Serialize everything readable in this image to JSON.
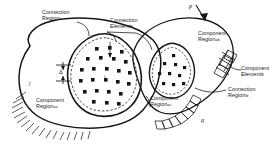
{
  "figure": {
    "name": "component-connection-decomposition-diagram",
    "stroke_color": "#151515",
    "background": "#ffffff"
  },
  "labels": {
    "connection_region_a": {
      "line1": "Connection",
      "line2": "Region",
      "sub": "Ia"
    },
    "connection_elements_top": {
      "line1": "Connection",
      "line2": "Elements"
    },
    "component_region_b_top": {
      "line1": "Component",
      "line2": "Region",
      "sub": "ab"
    },
    "component_elements_right": {
      "line1": "Component",
      "line2": "Elements"
    },
    "connection_region_b": {
      "line1": "Connection",
      "line2": "Region",
      "sub": "Ib"
    },
    "component_region_a_left": {
      "line1": "Component",
      "line2": "Region",
      "sub": "aa"
    },
    "component_region_c_mid": {
      "line1": "Component",
      "line2": "Region",
      "sub": "ac"
    }
  },
  "symbols": {
    "load_p": "p",
    "load_q": "q",
    "node_j": "j",
    "node_i": "i",
    "gap_delta": "Δ"
  }
}
